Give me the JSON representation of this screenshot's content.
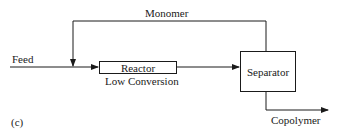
{
  "diagram": {
    "panel_label": "(c)",
    "nodes": {
      "reactor": {
        "label": "Reactor",
        "sublabel": "Low Conversion"
      },
      "separator": {
        "label": "Separator"
      }
    },
    "streams": {
      "feed": "Feed",
      "recycle": "Monomer",
      "product": "Copolymer"
    },
    "edges": [
      {
        "from": "feed",
        "to": "reactor"
      },
      {
        "from": "reactor",
        "to": "separator"
      },
      {
        "from": "separator",
        "to": "reactor",
        "label": "Monomer",
        "type": "recycle"
      },
      {
        "from": "separator",
        "to": "product",
        "label": "Copolymer"
      }
    ],
    "colors": {
      "line": "#1a1a1a",
      "background": "#ffffff"
    }
  }
}
